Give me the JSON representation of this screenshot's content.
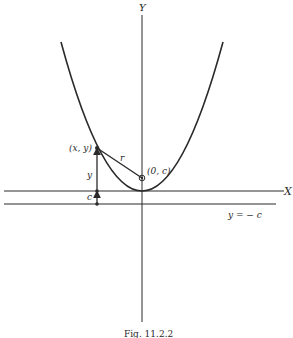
{
  "figure": {
    "caption": "Fig. 11.2.2",
    "colors": {
      "ink": "#2a2a2a",
      "background": "#ffffff"
    }
  },
  "axes": {
    "x_label": "X",
    "y_label": "Y"
  },
  "labels": {
    "point": "(x, y)",
    "focus": "(0, c)",
    "distance": "r",
    "height": "y",
    "offset": "c",
    "directrix": "y = − c"
  }
}
